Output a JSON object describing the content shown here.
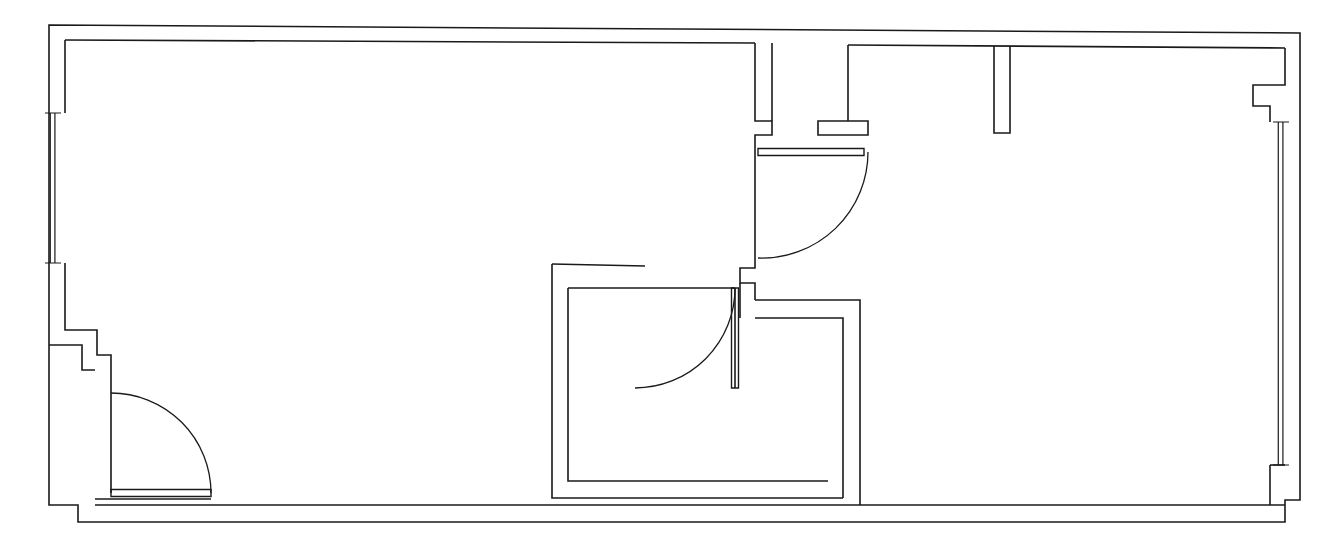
{
  "document": {
    "type": "architectural-floor-plan",
    "title": "Floor Plan",
    "orientation": "landscape",
    "background_color": "#ffffff",
    "line_color": "#1a1a1a",
    "canvas": {
      "width": 1343,
      "height": 560
    }
  },
  "drawing": {
    "wall_thickness_px": 16,
    "style": "double-line monochrome CAD linework",
    "scale_note": ""
  },
  "spaces": [
    {
      "id": "space-main-left",
      "name": "large-left-room",
      "approx_bounds": {
        "x": 65,
        "y": 40,
        "width": 690,
        "height": 455
      }
    },
    {
      "id": "space-center",
      "name": "center-enclosed-room",
      "approx_bounds": {
        "x": 568,
        "y": 288,
        "width": 275,
        "height": 210
      }
    },
    {
      "id": "space-right",
      "name": "right-room",
      "approx_bounds": {
        "x": 860,
        "y": 40,
        "width": 425,
        "height": 465
      }
    },
    {
      "id": "space-upper-right-alcove",
      "name": "upper-right-alcove",
      "approx_bounds": {
        "x": 1000,
        "y": 40,
        "width": 285,
        "height": 95
      }
    }
  ],
  "walls": {
    "exterior_outline": "M 49,25 L 1300,33 L 1300,500 L 1285,500 L 1285,522 L 78,522 L 78,505 L 49,505 Z",
    "notes": "outer perimeter with stepped corners at lower-left and right"
  },
  "windows": [
    {
      "id": "window-left",
      "name": "left-wall-window",
      "wall": "left-exterior",
      "orientation": "vertical",
      "x": 45,
      "y": 113,
      "length": 150,
      "thickness": 16
    },
    {
      "id": "window-right",
      "name": "right-wall-window",
      "wall": "right-exterior",
      "orientation": "vertical",
      "x": 1273,
      "y": 122,
      "length": 343,
      "thickness": 16
    }
  ],
  "doors": [
    {
      "id": "door-entry",
      "name": "entry-door-lower-left",
      "hinge": {
        "x": 111,
        "y": 393
      },
      "radius": 100,
      "swing": "clockwise-down-right",
      "leaf_orientation": "horizontal",
      "leaf_from": {
        "x": 111,
        "y": 493
      },
      "leaf_to": {
        "x": 211,
        "y": 493
      }
    },
    {
      "id": "door-upper-middle",
      "name": "upper-middle-door",
      "hinge": {
        "x": 864,
        "y": 152
      },
      "radius": 106,
      "swing": "counter-clockwise-down-left",
      "leaf_orientation": "horizontal",
      "leaf_from": {
        "x": 758,
        "y": 152
      },
      "leaf_to": {
        "x": 864,
        "y": 152
      }
    },
    {
      "id": "door-center-room",
      "name": "center-room-door",
      "hinge": {
        "x": 735,
        "y": 288
      },
      "radius": 100,
      "swing": "clockwise-down-left",
      "leaf_orientation": "vertical",
      "leaf_from": {
        "x": 735,
        "y": 288
      },
      "leaf_to": {
        "x": 735,
        "y": 388
      }
    }
  ],
  "labels": {
    "room_names": [],
    "dimensions": [],
    "annotations": []
  }
}
